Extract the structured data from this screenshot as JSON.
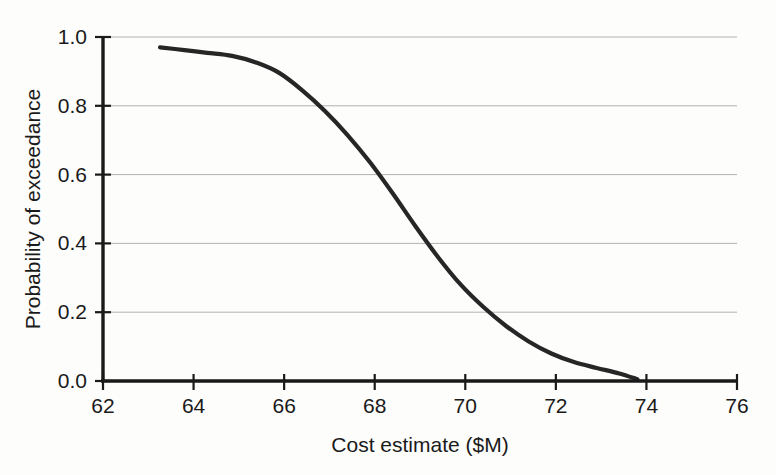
{
  "chart_data": {
    "type": "line",
    "title": "",
    "xlabel": "Cost estimate ($M)",
    "ylabel": "Probability of exceedance",
    "xlim": [
      62,
      76
    ],
    "ylim": [
      0.0,
      1.0
    ],
    "xticks": [
      "62",
      "64",
      "66",
      "68",
      "70",
      "72",
      "74",
      "76"
    ],
    "yticks": [
      "0.0",
      "0.2",
      "0.4",
      "0.6",
      "0.8",
      "1.0"
    ],
    "grid": "horizontal",
    "legend": "none",
    "series": [
      {
        "name": "Exceedance curve",
        "color": "#262626",
        "x": [
          63.26,
          63.8,
          64.3,
          64.85,
          65.4,
          65.9,
          66.4,
          66.9,
          67.4,
          67.9,
          68.4,
          68.9,
          69.4,
          69.9,
          70.4,
          70.9,
          71.4,
          71.9,
          72.4,
          72.9,
          73.4,
          73.8
        ],
        "y": [
          0.97,
          0.962,
          0.954,
          0.945,
          0.925,
          0.895,
          0.845,
          0.785,
          0.715,
          0.635,
          0.545,
          0.45,
          0.36,
          0.28,
          0.215,
          0.16,
          0.115,
          0.08,
          0.055,
          0.038,
          0.022,
          0.005
        ]
      }
    ]
  },
  "axis": {
    "x_title": "Cost estimate ($M)",
    "y_title": "Probability of exceedance",
    "x_tick_labels": [
      "62",
      "64",
      "66",
      "68",
      "70",
      "72",
      "74",
      "76"
    ],
    "y_tick_labels": [
      "1.0",
      "0.8",
      "0.6",
      "0.4",
      "0.2",
      "0.0"
    ]
  },
  "colors": {
    "curve": "#262626",
    "gridline": "#a9a9a9",
    "axis": "#1a1a1a",
    "background": "#fdfdfc"
  }
}
